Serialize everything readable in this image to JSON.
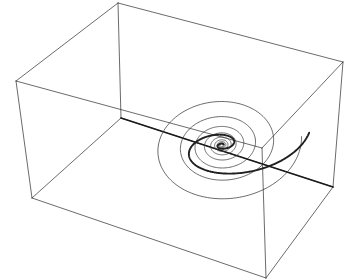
{
  "figure": {
    "name": "3d-spiral-trajectory-plot",
    "title": "",
    "background_color": "#ffffff",
    "width": 344,
    "height": 280
  },
  "colors": {
    "box_edge": "#2b2b2b",
    "axis_line": "#1a1a1a",
    "trajectory_main": "#202020",
    "trajectory_spiral": "#3a3a3a",
    "background": "#ffffff"
  },
  "chart_data": {
    "type": "line",
    "title": "",
    "xlabel": "",
    "ylabel": "",
    "zlabel": "",
    "grid": false,
    "legend": "none",
    "axis_ticks": [],
    "projection": "3d-perspective-wireframe",
    "series": [
      {
        "name": "bounding-box-wireframe",
        "role": "axes-box",
        "vertices": {
          "top_back": [
            118,
            3
          ],
          "top_left": [
            16,
            81
          ],
          "top_right": [
            343,
            62
          ],
          "top_front": [
            262,
            148
          ],
          "bottom_left": [
            32,
            198
          ],
          "bottom_front": [
            266,
            278
          ],
          "bottom_right": [
            333,
            187
          ],
          "bottom_back": [
            121,
            118
          ]
        },
        "edges": [
          [
            "top_back",
            "top_left"
          ],
          [
            "top_back",
            "top_right"
          ],
          [
            "top_left",
            "top_front"
          ],
          [
            "top_right",
            "top_front"
          ],
          [
            "top_left",
            "bottom_left"
          ],
          [
            "top_front",
            "bottom_front"
          ],
          [
            "top_right",
            "bottom_right"
          ],
          [
            "bottom_left",
            "bottom_front"
          ],
          [
            "bottom_front",
            "bottom_right"
          ],
          [
            "top_back",
            "bottom_back"
          ],
          [
            "bottom_back",
            "bottom_left"
          ],
          [
            "bottom_back",
            "bottom_right"
          ]
        ]
      },
      {
        "name": "diagonal-axis-line",
        "role": "axis",
        "from": [
          121,
          118
        ],
        "to": [
          333,
          187
        ]
      },
      {
        "name": "main-trajectory",
        "role": "spiral-outer-heavy",
        "center": [
          222,
          145
        ],
        "turns": 1.9,
        "start_radius_x": 88,
        "start_radius_y": 48,
        "end_radius_x": 2,
        "end_radius_y": 1,
        "rotation_deg": -8
      },
      {
        "name": "projected-spiral",
        "role": "spiral-inner-thin",
        "center": [
          222,
          145
        ],
        "turns": 9.2,
        "start_radius_x": 80,
        "start_radius_y": 60,
        "end_radius_x": 1.5,
        "end_radius_y": 1.2,
        "rotation_deg": -6
      }
    ]
  }
}
